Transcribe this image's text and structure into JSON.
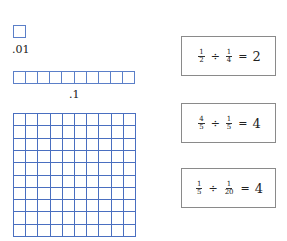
{
  "models": {
    "hundredth": {
      "label": ".01",
      "cells": 1
    },
    "tenth": {
      "label": ".1",
      "cells": 10
    },
    "whole": {
      "rows": 10,
      "cols": 10
    },
    "grid_color": "#4a6fc0"
  },
  "equations": [
    {
      "dividend": {
        "num": "1",
        "den": "2"
      },
      "operator": "÷",
      "divisor": {
        "num": "1",
        "den": "4"
      },
      "equals": "=",
      "result": "2"
    },
    {
      "dividend": {
        "num": "4",
        "den": "5"
      },
      "operator": "÷",
      "divisor": {
        "num": "1",
        "den": "5"
      },
      "equals": "=",
      "result": "4"
    },
    {
      "dividend": {
        "num": "1",
        "den": "5"
      },
      "operator": "÷",
      "divisor": {
        "num": "1",
        "den": "20"
      },
      "equals": "=",
      "result": "4"
    }
  ]
}
